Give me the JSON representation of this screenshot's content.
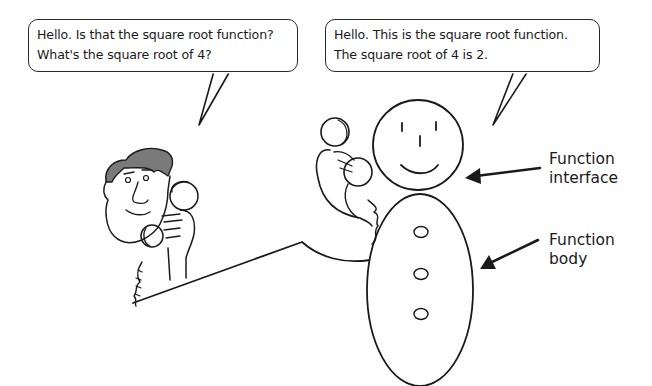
{
  "diagram": {
    "caller_bubble": {
      "lines": [
        "Hello. Is that the square root function?",
        "What's the square root of 4?"
      ]
    },
    "function_bubble": {
      "lines": [
        "Hello. This is the square root function.",
        "The square root of 4 is 2."
      ]
    },
    "labels": {
      "interface": [
        "Function",
        "interface"
      ],
      "body": [
        "Function",
        "body"
      ]
    },
    "figures": {
      "caller": "man-on-telephone",
      "function": "snowman-figure-on-telephone",
      "function_head": "function-interface",
      "function_torso": "function-body",
      "torso_buttons": 3
    },
    "colors": {
      "ink": "#1a1a1a",
      "hair": "#7a7a7a",
      "background": "#ffffff"
    }
  }
}
